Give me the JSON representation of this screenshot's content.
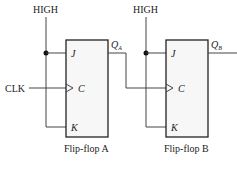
{
  "inputs": {
    "high_a": "HIGH",
    "high_b": "HIGH",
    "clk": "CLK"
  },
  "flipflops": [
    {
      "name": "Flip-flop A",
      "pins": {
        "j": "J",
        "c": "C",
        "k": "K"
      },
      "output": "Q",
      "output_sub": "A"
    },
    {
      "name": "Flip-flop B",
      "pins": {
        "j": "J",
        "c": "C",
        "k": "K"
      },
      "output": "Q",
      "output_sub": "B"
    }
  ]
}
